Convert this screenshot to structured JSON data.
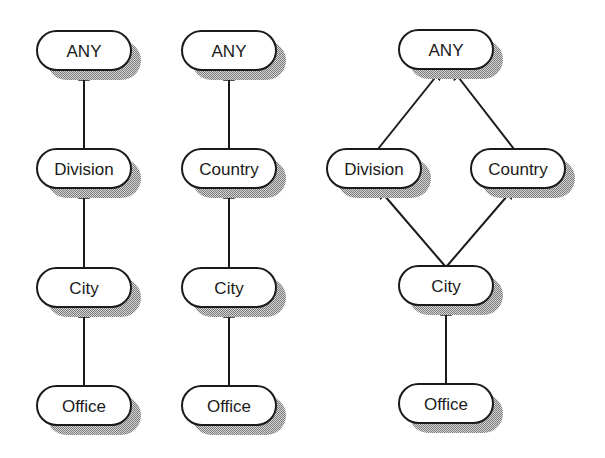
{
  "colors": {
    "background": "#ffffff",
    "node_fill": "#ffffff",
    "node_stroke": "#1a1a1a",
    "edge": "#1a1a1a",
    "shadow_dark": "#7a7a7a",
    "shadow_light": "#d6d6d6"
  },
  "node_size": {
    "width": 94,
    "height": 39,
    "radius": 19.5
  },
  "shadow_offset": {
    "dx": 10,
    "dy": 10
  },
  "diagrams": [
    {
      "id": "hierarchy-division",
      "nodes": [
        {
          "id": "d1-any",
          "label": "ANY",
          "x": 37,
          "y": 31
        },
        {
          "id": "d1-division",
          "label": "Division",
          "x": 37,
          "y": 149
        },
        {
          "id": "d1-city",
          "label": "City",
          "x": 37,
          "y": 268
        },
        {
          "id": "d1-office",
          "label": "Office",
          "x": 37,
          "y": 386
        }
      ],
      "edges": [
        {
          "from": "d1-division",
          "to": "d1-any"
        },
        {
          "from": "d1-city",
          "to": "d1-division"
        },
        {
          "from": "d1-office",
          "to": "d1-city"
        }
      ]
    },
    {
      "id": "hierarchy-country",
      "nodes": [
        {
          "id": "d2-any",
          "label": "ANY",
          "x": 182,
          "y": 31
        },
        {
          "id": "d2-country",
          "label": "Country",
          "x": 182,
          "y": 149
        },
        {
          "id": "d2-city",
          "label": "City",
          "x": 182,
          "y": 268
        },
        {
          "id": "d2-office",
          "label": "Office",
          "x": 182,
          "y": 386
        }
      ],
      "edges": [
        {
          "from": "d2-country",
          "to": "d2-any"
        },
        {
          "from": "d2-city",
          "to": "d2-country"
        },
        {
          "from": "d2-office",
          "to": "d2-city"
        }
      ]
    },
    {
      "id": "lattice-combined",
      "nodes": [
        {
          "id": "d3-any",
          "label": "ANY",
          "x": 399,
          "y": 30
        },
        {
          "id": "d3-division",
          "label": "Division",
          "x": 327,
          "y": 149
        },
        {
          "id": "d3-country",
          "label": "Country",
          "x": 471,
          "y": 149
        },
        {
          "id": "d3-city",
          "label": "City",
          "x": 399,
          "y": 266
        },
        {
          "id": "d3-office",
          "label": "Office",
          "x": 399,
          "y": 384
        }
      ],
      "edges": [
        {
          "from": "d3-division",
          "to": "d3-any",
          "x1": 378,
          "y1": 149,
          "x2": 442,
          "y2": 69
        },
        {
          "from": "d3-country",
          "to": "d3-any",
          "x1": 514,
          "y1": 149,
          "x2": 452,
          "y2": 69
        },
        {
          "from": "d3-city",
          "to": "d3-division",
          "x1": 445,
          "y1": 266,
          "x2": 378,
          "y2": 188
        },
        {
          "from": "d3-city",
          "to": "d3-country",
          "x1": 447,
          "y1": 266,
          "x2": 514,
          "y2": 188
        },
        {
          "from": "d3-office",
          "to": "d3-city",
          "x1": 446,
          "y1": 384,
          "x2": 446,
          "y2": 305
        }
      ]
    }
  ]
}
